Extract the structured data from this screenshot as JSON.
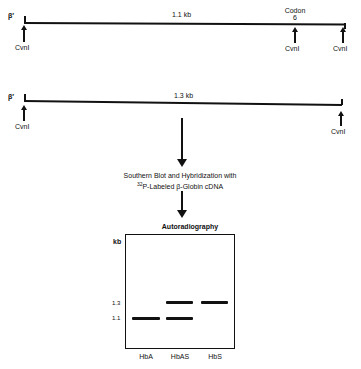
{
  "map1": {
    "end_label": "β′",
    "size_label": "1.1 kb",
    "codon_label_line1": "Codon",
    "codon_label_line2": "6",
    "sites": [
      "CvnI",
      "CvnI",
      "CvnI"
    ]
  },
  "map2": {
    "end_label": "β′",
    "size_label": "1.3 kb",
    "sites": [
      "CvnI",
      "CvnI"
    ]
  },
  "step": {
    "line1": "Southern Blot and Hybridization with",
    "line2_sup": "32",
    "line2": "P-Labeled β-Globin cDNA"
  },
  "gel": {
    "title": "Autoradiography",
    "y_unit": "kb",
    "markers": [
      {
        "label": "1.3",
        "kb": 1.3
      },
      {
        "label": "1.1",
        "kb": 1.1
      }
    ],
    "lanes": [
      {
        "label": "HbA",
        "bands_kb": [
          1.1
        ]
      },
      {
        "label": "HbAS",
        "bands_kb": [
          1.3,
          1.1
        ]
      },
      {
        "label": "HbS",
        "bands_kb": [
          1.3
        ]
      }
    ]
  }
}
